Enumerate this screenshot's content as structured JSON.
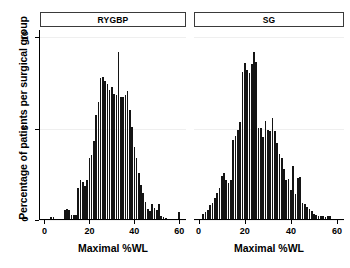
{
  "chart_data": {
    "type": "bar",
    "title": "",
    "xlabel": "Maximal %WL",
    "ylabel": "Percentage of patients per surgical group",
    "xlim": [
      -2,
      63
    ],
    "ylim": [
      0,
      10.4
    ],
    "xticks": [
      0,
      20,
      40,
      60
    ],
    "yticks": [
      0,
      5,
      10
    ],
    "grid": true,
    "legend_position": "none",
    "panels": [
      {
        "label": "RYGBP",
        "x": [
          3,
          4,
          9,
          10,
          11,
          12,
          13,
          14,
          15,
          16,
          17,
          18,
          19,
          20,
          21,
          22,
          23,
          24,
          25,
          26,
          27,
          28,
          29,
          30,
          31,
          32,
          33,
          34,
          35,
          36,
          37,
          38,
          39,
          40,
          41,
          42,
          43,
          44,
          45,
          46,
          47,
          48,
          49,
          50,
          51,
          52,
          53,
          54,
          55,
          60
        ],
        "values": [
          0.15,
          0.15,
          0.55,
          0.6,
          0.55,
          0.25,
          0.3,
          0.3,
          1.75,
          2.2,
          2.1,
          1.85,
          2.2,
          3.4,
          3.55,
          4.35,
          5.75,
          6.45,
          7.75,
          7.85,
          7.6,
          7.45,
          7.1,
          7.3,
          6.9,
          6.85,
          9.2,
          6.75,
          6.75,
          6.85,
          7.05,
          6.0,
          5.1,
          4.0,
          3.4,
          2.55,
          1.9,
          1.5,
          1.0,
          0.6,
          0.5,
          0.85,
          0.65,
          0.55,
          0.9,
          0.2,
          0.15,
          0.1,
          0.05,
          0.45
        ]
      },
      {
        "label": "SG",
        "x": [
          2,
          3,
          4,
          5,
          6,
          7,
          8,
          9,
          10,
          11,
          12,
          13,
          14,
          15,
          16,
          17,
          18,
          19,
          20,
          21,
          22,
          23,
          24,
          25,
          26,
          27,
          28,
          29,
          30,
          31,
          32,
          33,
          34,
          35,
          36,
          37,
          38,
          39,
          40,
          41,
          42,
          43,
          44,
          45,
          46,
          47,
          48,
          49,
          50,
          51,
          52,
          53,
          54,
          55,
          56,
          57
        ],
        "values": [
          0.35,
          0.45,
          0.55,
          0.8,
          0.95,
          1.2,
          1.5,
          1.75,
          2.4,
          2.55,
          2.2,
          2.05,
          2.2,
          4.4,
          4.6,
          4.95,
          5.35,
          8.1,
          8.6,
          8.2,
          8.05,
          8.55,
          9.2,
          8.65,
          5.05,
          5.05,
          4.55,
          5.4,
          4.9,
          4.85,
          5.6,
          4.85,
          4.2,
          3.6,
          3.4,
          2.8,
          2.2,
          2.25,
          1.65,
          2.95,
          1.45,
          2.3,
          2.35,
          0.95,
          0.85,
          0.7,
          0.6,
          0.5,
          0.35,
          0.25,
          0.2,
          0.2,
          0.2,
          0.15,
          0.2,
          0.2
        ]
      }
    ]
  },
  "axis": {
    "ylabel": "Percentage of patients per surgical group",
    "xlabel_left": "Maximal %WL",
    "xlabel_right": "Maximal %WL",
    "ytick_labels": [
      "0",
      "5",
      "10"
    ],
    "xtick_labels": [
      "0",
      "20",
      "40",
      "60"
    ]
  },
  "panel_titles": {
    "left": "RYGBP",
    "right": "SG"
  },
  "colors": {
    "bar": "#141414",
    "axis": "#000000",
    "grid": "#efefef",
    "strip_border": "#3a3a3a",
    "background": "#ffffff"
  }
}
